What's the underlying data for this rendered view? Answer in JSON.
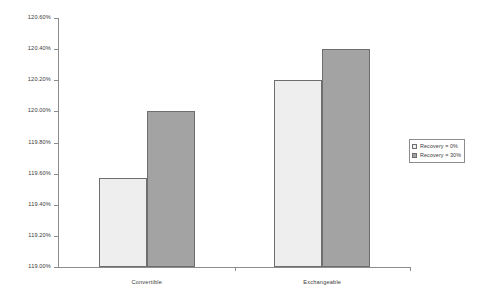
{
  "chart_data": {
    "type": "bar",
    "title": "",
    "subtitle": "",
    "xlabel": "",
    "ylabel": "",
    "categories": [
      "Convertible",
      "Exchangeable"
    ],
    "series": [
      {
        "name": "Recovery = 0%",
        "values": [
          119.57,
          120.2
        ],
        "color": "#eeeeee"
      },
      {
        "name": "Recovery = 30%",
        "values": [
          120.0,
          120.4
        ],
        "color": "#a3a3a3"
      }
    ],
    "ylim": [
      119.0,
      120.6
    ],
    "ytick_values": [
      119.0,
      119.2,
      119.4,
      119.6,
      119.8,
      120.0,
      120.2,
      120.4,
      120.6
    ],
    "ytick_labels": [
      "119.00%",
      "119.20%",
      "119.40%",
      "119.60%",
      "119.80%",
      "120.00%",
      "120.20%",
      "120.40%",
      "120.60%"
    ],
    "grid": false,
    "legend_position": "right"
  },
  "legend": {
    "entries": [
      {
        "label": "Recovery = 0%"
      },
      {
        "label": "Recovery = 30%"
      }
    ]
  },
  "axis": {
    "axis_color": "#8c8c8c",
    "bar_border_color": "#6e6e6e"
  }
}
